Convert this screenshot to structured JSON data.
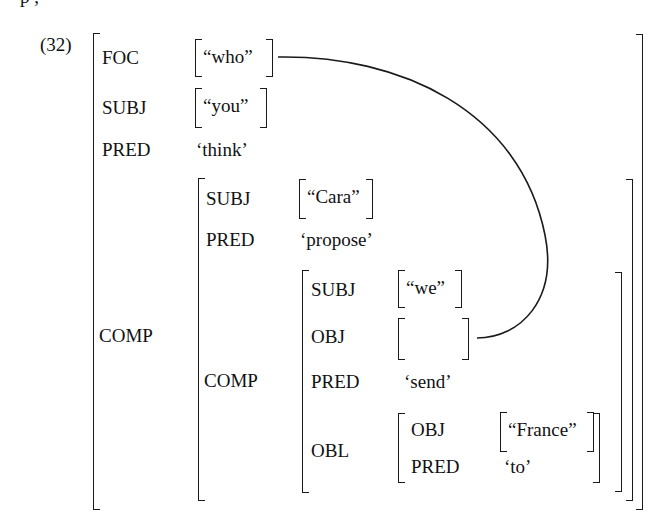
{
  "example_number": "(32)",
  "cutoff_text": "p                                    ,",
  "fstructure": {
    "outer": {
      "foc": {
        "attr": "FOC",
        "value": "“who”"
      },
      "subj": {
        "attr": "SUBJ",
        "value": "“you”"
      },
      "pred": {
        "attr": "PRED",
        "value": "‘think’"
      },
      "comp": {
        "attr": "COMP"
      }
    },
    "comp1": {
      "subj": {
        "attr": "SUBJ",
        "value": "“Cara”"
      },
      "pred": {
        "attr": "PRED",
        "value": "‘propose’"
      },
      "comp": {
        "attr": "COMP"
      }
    },
    "comp2": {
      "subj": {
        "attr": "SUBJ",
        "value": "“we”"
      },
      "obj": {
        "attr": "OBJ",
        "value": ""
      },
      "pred": {
        "attr": "PRED",
        "value": "‘send’"
      },
      "obl": {
        "attr": "OBL"
      }
    },
    "obl": {
      "obj": {
        "attr": "OBJ",
        "value": "“France”"
      },
      "pred": {
        "attr": "PRED",
        "value": "‘to’"
      }
    }
  },
  "connector": {
    "from": "FOC value “who”",
    "to": "empty OBJ of COMP COMP",
    "color": "#1a1a1a"
  }
}
